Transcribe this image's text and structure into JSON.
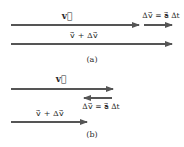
{
  "colors": {
    "arrow": "#555555",
    "text": "#2a2a2a",
    "background": "#ffffff"
  },
  "panel_a": {
    "caption": "(a)",
    "v_label": "v⃗",
    "dv_label": "Δv⃗ = a⃗ Δt",
    "sum_label": "v⃗ + Δv⃗"
  },
  "panel_b": {
    "caption": "(b)",
    "v_label": "v⃗",
    "dv_label": "Δv⃗ = a⃗ Δt",
    "sum_label": "v⃗ + Δv⃗"
  }
}
